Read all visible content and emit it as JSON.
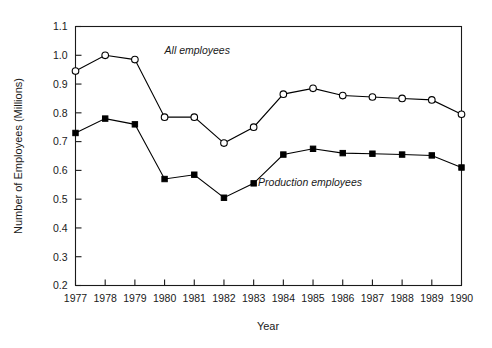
{
  "chart_data": {
    "type": "line",
    "title": "",
    "xlabel": "Year",
    "ylabel": "Number of Employees (Millions)",
    "categories": [
      1977,
      1978,
      1979,
      1980,
      1981,
      1982,
      1983,
      1984,
      1985,
      1986,
      1987,
      1988,
      1989,
      1990
    ],
    "xlim": [
      1977,
      1990
    ],
    "ylim": [
      0.2,
      1.1
    ],
    "ytick_labels": [
      "0.2",
      "0.3",
      "0.4",
      "0.5",
      "0.6",
      "0.7",
      "0.8",
      "0.9",
      "1.0",
      "1.1"
    ],
    "ytick_values": [
      0.2,
      0.3,
      0.4,
      0.5,
      0.6,
      0.7,
      0.8,
      0.9,
      1.0,
      1.1
    ],
    "xtick_labels": [
      "1977",
      "1978",
      "1979",
      "1980",
      "1981",
      "1982",
      "1983",
      "1984",
      "1985",
      "1986",
      "1987",
      "1988",
      "1989",
      "1990"
    ],
    "grid": false,
    "legend_position": "inline-annotation",
    "series": [
      {
        "name": "All employees",
        "marker": "open-circle",
        "annotation_x": 1980.0,
        "annotation_y": 1.005,
        "values": [
          0.945,
          1.0,
          0.985,
          0.785,
          0.785,
          0.695,
          0.75,
          0.865,
          0.885,
          0.86,
          0.855,
          0.85,
          0.845,
          0.795
        ]
      },
      {
        "name": "Production employees",
        "marker": "filled-square",
        "annotation_x": 1983.15,
        "annotation_y": 0.545,
        "values": [
          0.73,
          0.78,
          0.76,
          0.57,
          0.585,
          0.505,
          0.555,
          0.655,
          0.675,
          0.66,
          0.658,
          0.655,
          0.652,
          0.61
        ]
      }
    ]
  }
}
